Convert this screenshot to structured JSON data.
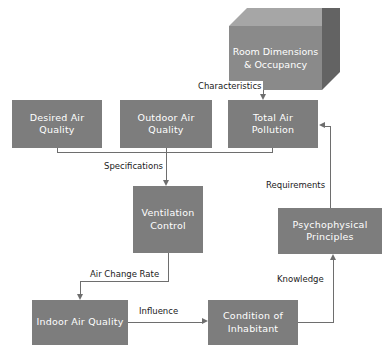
{
  "diagram": {
    "type": "flowchart",
    "colors": {
      "node_fill": "#7d7d7d",
      "node_text": "#ffffff",
      "cube_front": "#8a8a8a",
      "cube_top": "#a6a6a6",
      "cube_side": "#636363",
      "connector": "#6e6e6e",
      "label_text": "#1a1a1a",
      "background": "#ffffff"
    },
    "nodes": [
      {
        "id": "room",
        "label": "Room Dimensions & Occupancy",
        "shape": "cube"
      },
      {
        "id": "desired",
        "label": "Desired Air Quality",
        "shape": "rect"
      },
      {
        "id": "outdoor",
        "label": "Outdoor Air Quality",
        "shape": "rect"
      },
      {
        "id": "pollution",
        "label": "Total Air Pollution",
        "shape": "rect"
      },
      {
        "id": "ventilation",
        "label": "Ventilation Control",
        "shape": "rect"
      },
      {
        "id": "psycho",
        "label": "Psychophysical Principles",
        "shape": "rect"
      },
      {
        "id": "indoor",
        "label": "Indoor Air Quality",
        "shape": "rect"
      },
      {
        "id": "condition",
        "label": "Condition of Inhabitant",
        "shape": "rect"
      }
    ],
    "edges": [
      {
        "id": "e1",
        "from": "room",
        "to": "pollution",
        "label": "Characteristics"
      },
      {
        "id": "e2",
        "from": "psycho",
        "to": "pollution",
        "label": "Requirements"
      },
      {
        "id": "e3",
        "from": "desired",
        "to": "ventilation",
        "label": "Specifications"
      },
      {
        "id": "e4",
        "from": "outdoor",
        "to": "ventilation",
        "label": ""
      },
      {
        "id": "e5",
        "from": "pollution",
        "to": "ventilation",
        "label": ""
      },
      {
        "id": "e6",
        "from": "ventilation",
        "to": "indoor",
        "label": "Air Change Rate"
      },
      {
        "id": "e7",
        "from": "indoor",
        "to": "condition",
        "label": "Influence"
      },
      {
        "id": "e8",
        "from": "condition",
        "to": "psycho",
        "label": "Knowledge"
      }
    ]
  }
}
